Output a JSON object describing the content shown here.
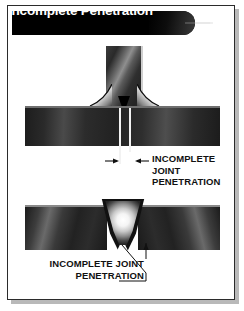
{
  "figure": {
    "title": "Incomplete Penetration",
    "frame_color": "#2b2b2b",
    "banner_color": "#000000",
    "banner_text_color": "#ffffff",
    "background": "#ffffff"
  },
  "diagrams": [
    {
      "id": "tee-joint",
      "joint_type": "Tee joint with double fillet weld",
      "callout": {
        "lines": [
          "INCOMPLETE",
          "JOINT",
          "PENETRATION"
        ],
        "full_text": "INCOMPLETE JOINT PENETRATION",
        "leader_style": "dimension-arrows"
      }
    },
    {
      "id": "groove-joint",
      "joint_type": "Butt joint with V-groove weld",
      "callout": {
        "lines": [
          "INCOMPLETE JOINT",
          "PENETRATION"
        ],
        "full_text": "INCOMPLETE JOINT PENETRATION",
        "leader_style": "diagonal-leader-with-arrow"
      }
    }
  ],
  "icons": {
    "sparkle": "starburst-sparkle"
  }
}
